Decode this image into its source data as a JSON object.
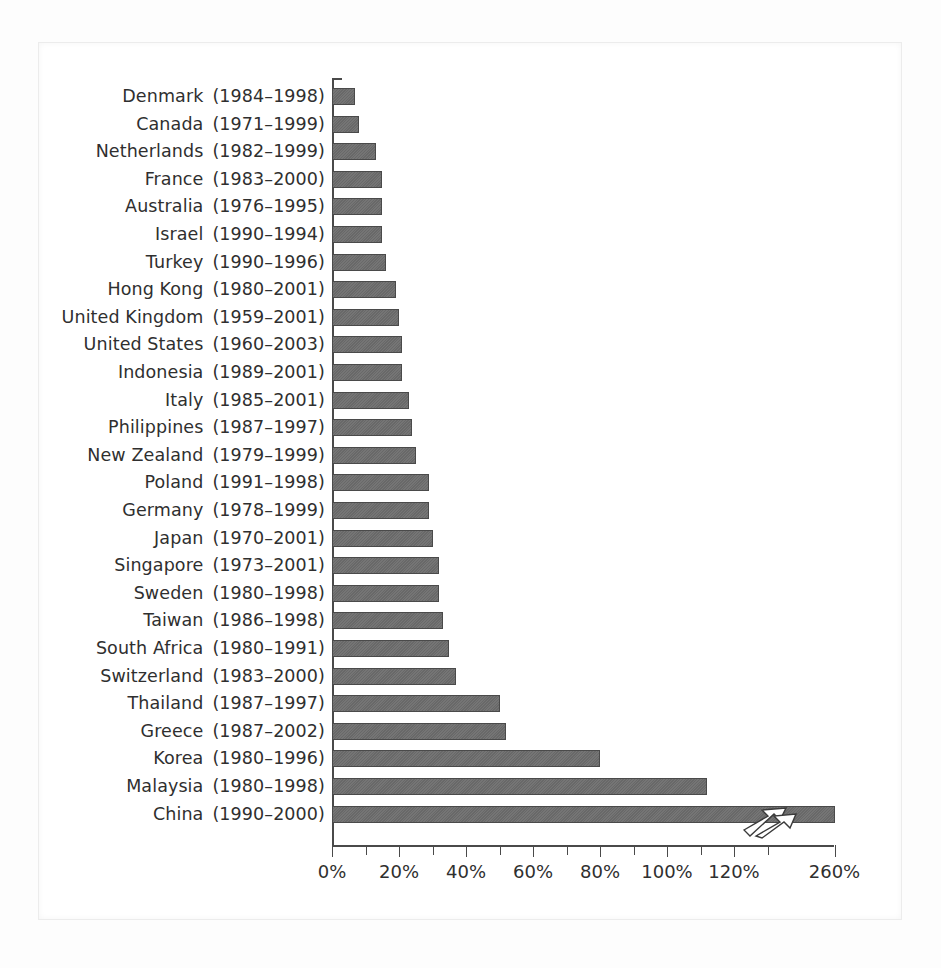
{
  "chart_data": {
    "type": "bar",
    "orientation": "horizontal",
    "title": "",
    "subtitle": "",
    "xlabel": "",
    "ylabel": "",
    "xlim": [
      0,
      150
    ],
    "grid": false,
    "legend": null,
    "axis_break": {
      "present": true,
      "note": "Axis is broken between 120% and 260%; the China bar is drawn with a zigzag break symbol",
      "break_after_tick": "120%",
      "final_tick": "260%"
    },
    "xticks": [
      {
        "label": "0%",
        "value": 0
      },
      {
        "label": "",
        "value": 10
      },
      {
        "label": "20%",
        "value": 20
      },
      {
        "label": "",
        "value": 30
      },
      {
        "label": "40%",
        "value": 40
      },
      {
        "label": "",
        "value": 50
      },
      {
        "label": "60%",
        "value": 60
      },
      {
        "label": "",
        "value": 70
      },
      {
        "label": "80%",
        "value": 80
      },
      {
        "label": "",
        "value": 90
      },
      {
        "label": "100%",
        "value": 100
      },
      {
        "label": "",
        "value": 110
      },
      {
        "label": "120%",
        "value": 120
      },
      {
        "label": "",
        "value": 130
      },
      {
        "label": "260%",
        "value": 150
      }
    ],
    "categories": [
      "Denmark (1984–1998)",
      "Canada (1971–1999)",
      "Netherlands (1982–1999)",
      "France (1983–2000)",
      "Australia (1976–1995)",
      "Israel (1990–1994)",
      "Turkey (1990–1996)",
      "Hong Kong (1980–2001)",
      "United Kingdom (1959–2001)",
      "United States (1960–2003)",
      "Indonesia (1989–2001)",
      "Italy (1985–2001)",
      "Philippines (1987–1997)",
      "New Zealand (1979–1999)",
      "Poland (1991–1998)",
      "Germany (1978–1999)",
      "Japan (1970–2001)",
      "Singapore (1973–2001)",
      "Sweden (1980–1998)",
      "Taiwan (1986–1998)",
      "South Africa (1980–1991)",
      "Switzerland (1983–2000)",
      "Thailand (1987–1997)",
      "Greece (1987–2002)",
      "Korea (1980–1996)",
      "Malaysia (1980–1998)",
      "China (1990–2000)"
    ],
    "values": [
      7,
      8,
      13,
      15,
      15,
      15,
      16,
      19,
      20,
      21,
      21,
      23,
      24,
      25,
      29,
      29,
      30,
      32,
      32,
      33,
      35,
      37,
      50,
      52,
      80,
      112,
      260
    ]
  },
  "rows": [
    {
      "country": "Denmark",
      "years": "(1984–1998)",
      "value": 7
    },
    {
      "country": "Canada",
      "years": "(1971–1999)",
      "value": 8
    },
    {
      "country": "Netherlands",
      "years": "(1982–1999)",
      "value": 13
    },
    {
      "country": "France",
      "years": "(1983–2000)",
      "value": 15
    },
    {
      "country": "Australia",
      "years": "(1976–1995)",
      "value": 15
    },
    {
      "country": "Israel",
      "years": "(1990–1994)",
      "value": 15
    },
    {
      "country": "Turkey",
      "years": "(1990–1996)",
      "value": 16
    },
    {
      "country": "Hong Kong",
      "years": "(1980–2001)",
      "value": 19
    },
    {
      "country": "United Kingdom",
      "years": "(1959–2001)",
      "value": 20
    },
    {
      "country": "United States",
      "years": "(1960–2003)",
      "value": 21
    },
    {
      "country": "Indonesia",
      "years": "(1989–2001)",
      "value": 21
    },
    {
      "country": "Italy",
      "years": "(1985–2001)",
      "value": 23
    },
    {
      "country": "Philippines",
      "years": "(1987–1997)",
      "value": 24
    },
    {
      "country": "New Zealand",
      "years": "(1979–1999)",
      "value": 25
    },
    {
      "country": "Poland",
      "years": "(1991–1998)",
      "value": 29
    },
    {
      "country": "Germany",
      "years": "(1978–1999)",
      "value": 29
    },
    {
      "country": "Japan",
      "years": "(1970–2001)",
      "value": 30
    },
    {
      "country": "Singapore",
      "years": "(1973–2001)",
      "value": 32
    },
    {
      "country": "Sweden",
      "years": "(1980–1998)",
      "value": 32
    },
    {
      "country": "Taiwan",
      "years": "(1986–1998)",
      "value": 33
    },
    {
      "country": "South Africa",
      "years": "(1980–1991)",
      "value": 35
    },
    {
      "country": "Switzerland",
      "years": "(1983–2000)",
      "value": 37
    },
    {
      "country": "Thailand",
      "years": "(1987–1997)",
      "value": 50
    },
    {
      "country": "Greece",
      "years": "(1987–2002)",
      "value": 52
    },
    {
      "country": "Korea",
      "years": "(1980–1996)",
      "value": 80
    },
    {
      "country": "Malaysia",
      "years": "(1980–1998)",
      "value": 112
    },
    {
      "country": "China",
      "years": "(1990–2000)",
      "value": 150
    }
  ],
  "colors": {
    "bar_fill": "#6e6e6e",
    "bar_stroke": "#4a4a4a",
    "axis": "#4a4a4a",
    "text": "#2f2f2f",
    "background": "#ffffff",
    "frame": "#ececec"
  },
  "geometry": {
    "axis_x_px": 332,
    "px_per_percent": 3.35,
    "first_row_top_px": 83,
    "row_pitch_px": 27.6,
    "bar_height_px": 17
  }
}
